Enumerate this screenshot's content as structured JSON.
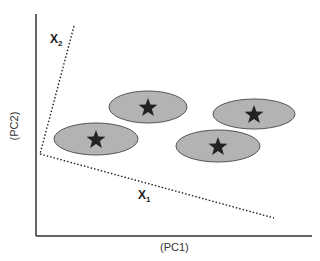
{
  "diagram": {
    "title": "",
    "x_axis_label": "(PC1)",
    "y_axis_label": "(PC2)",
    "vectors": [
      {
        "name": "X",
        "sub": "1"
      },
      {
        "name": "X",
        "sub": "2"
      }
    ],
    "clusters": [
      {
        "id": "cluster-left",
        "cx": 96,
        "cy": 139,
        "rx": 42,
        "ry": 16
      },
      {
        "id": "cluster-top",
        "cx": 148,
        "cy": 107,
        "rx": 39,
        "ry": 16
      },
      {
        "id": "cluster-right-top",
        "cx": 254,
        "cy": 114,
        "rx": 41,
        "ry": 15
      },
      {
        "id": "cluster-right-bottom",
        "cx": 218,
        "cy": 146,
        "rx": 42,
        "ry": 16
      }
    ],
    "colors": {
      "axis": "#333333",
      "ellipse_fill": "#b3b3b3",
      "ellipse_stroke": "#555555",
      "star": "#222222",
      "dotted": "#222222"
    }
  }
}
